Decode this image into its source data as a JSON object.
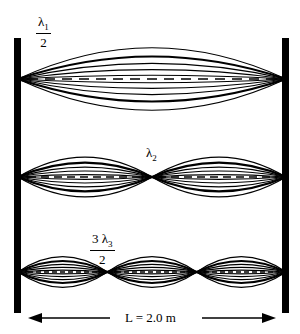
{
  "diagram": {
    "length_label": "L = 2.0 m",
    "modes": [
      {
        "harmonic": 1,
        "label_num": "λ",
        "label_sub": "1",
        "label_den": "2",
        "loops": 1
      },
      {
        "harmonic": 2,
        "label_num": "λ",
        "label_sub": "2",
        "label_den": "",
        "loops": 2
      },
      {
        "harmonic": 3,
        "label_num": "3 λ",
        "label_sub": "3",
        "label_den": "2",
        "loops": 3
      }
    ],
    "colors": {
      "ink": "#000000",
      "background": "#ffffff"
    }
  }
}
